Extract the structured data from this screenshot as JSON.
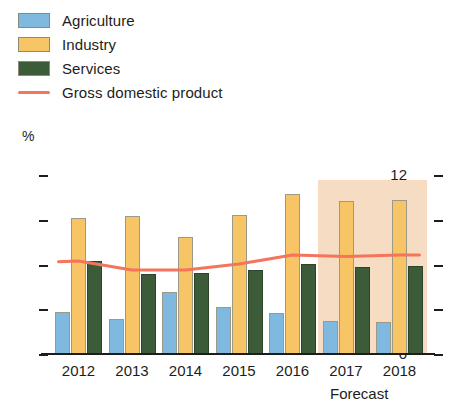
{
  "legend": {
    "items": [
      {
        "label": "Agriculture",
        "color": "#7fb9e0",
        "type": "swatch",
        "icon": "legend-swatch-agriculture"
      },
      {
        "label": "Industry",
        "color": "#f7c566",
        "type": "swatch",
        "icon": "legend-swatch-industry"
      },
      {
        "label": "Services",
        "color": "#3c5b38",
        "type": "swatch",
        "icon": "legend-swatch-services"
      },
      {
        "label": "Gross domestic product",
        "color": "#f4745c",
        "type": "line",
        "icon": "legend-line-gdp"
      }
    ]
  },
  "axis": {
    "unit_label": "%",
    "y_ticks": [
      "12",
      "9",
      "6",
      "3",
      "0"
    ],
    "forecast_note": "Forecast"
  },
  "chart_data": {
    "type": "bar",
    "title": "",
    "xlabel": "",
    "ylabel": "%",
    "ylim": [
      0,
      12
    ],
    "yticks": [
      0,
      3,
      6,
      9,
      12
    ],
    "grid": false,
    "legend_position": "top-left",
    "categories": [
      "2012",
      "2013",
      "2014",
      "2015",
      "2016",
      "2017",
      "2018"
    ],
    "forecast_categories": [
      "2017",
      "2018"
    ],
    "series": [
      {
        "name": "Agriculture",
        "type": "bar",
        "color": "#7fb9e0",
        "values": [
          2.9,
          2.4,
          4.2,
          3.2,
          2.8,
          2.3,
          2.2
        ]
      },
      {
        "name": "Industry",
        "type": "bar",
        "color": "#f7c566",
        "values": [
          9.2,
          9.3,
          7.9,
          9.4,
          10.8,
          10.3,
          10.4
        ]
      },
      {
        "name": "Services",
        "type": "bar",
        "color": "#3c5b38",
        "values": [
          6.3,
          5.4,
          5.5,
          5.7,
          6.1,
          5.9,
          6.0
        ]
      },
      {
        "name": "Gross domestic product",
        "type": "line",
        "color": "#f4745c",
        "values": [
          6.3,
          5.7,
          5.7,
          6.1,
          6.7,
          6.6,
          6.7
        ]
      }
    ]
  }
}
